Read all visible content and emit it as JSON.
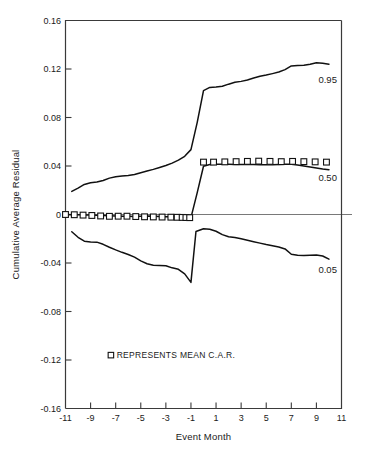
{
  "chart_data": {
    "type": "line",
    "title": "",
    "xlabel": "Event Month",
    "ylabel": "Cumulative Average Residual",
    "xlim": [
      -11,
      11
    ],
    "ylim": [
      -0.16,
      0.16
    ],
    "xticks": [
      -11,
      -9,
      -7,
      -5,
      -3,
      -1,
      1,
      3,
      5,
      7,
      9,
      11
    ],
    "xtick_labels": [
      "-11",
      "-9",
      "-7",
      "-5",
      "-3",
      "-1",
      "1",
      "3",
      "5",
      "7",
      "9",
      "11"
    ],
    "yticks": [
      0.16,
      0.12,
      0.08,
      0.04,
      0,
      -0.04,
      -0.08,
      -0.12,
      -0.16
    ],
    "ytick_labels": [
      "0.16",
      "0.12",
      "0.08",
      "0.04",
      "0",
      "-0.04",
      "-0.08",
      "-0.12",
      "-0.16"
    ],
    "grid": false,
    "zero_line": true,
    "legend": {
      "position": "inside-lower-left",
      "marker": "open-square",
      "text": "REPRESENTS MEAN C.A.R."
    },
    "series": [
      {
        "name": "0.95",
        "label": "0.95",
        "label_x": 9.9,
        "label_y": 0.1115,
        "x": [
          -10.5,
          -10,
          -9.5,
          -9,
          -8.5,
          -8,
          -7.5,
          -7,
          -6.5,
          -6,
          -5.5,
          -5,
          -4.5,
          -4,
          -3.5,
          -3,
          -2.5,
          -2,
          -1.5,
          -1,
          -0.5,
          0,
          0.5,
          1,
          1.5,
          2,
          2.5,
          3,
          3.5,
          4,
          4.5,
          5,
          5.5,
          6,
          6.5,
          7,
          7.5,
          8,
          8.5,
          9,
          9.5,
          10
        ],
        "y": [
          0.019,
          0.0218,
          0.0248,
          0.0262,
          0.0268,
          0.028,
          0.03,
          0.0312,
          0.0318,
          0.0322,
          0.033,
          0.0345,
          0.0358,
          0.0372,
          0.0388,
          0.0404,
          0.0424,
          0.0448,
          0.048,
          0.0535,
          0.076,
          0.1022,
          0.1048,
          0.1052,
          0.1058,
          0.1075,
          0.109,
          0.1098,
          0.111,
          0.1125,
          0.114,
          0.115,
          0.1162,
          0.1175,
          0.1195,
          0.1225,
          0.1228,
          0.123,
          0.124,
          0.1252,
          0.1248,
          0.124
        ]
      },
      {
        "name": "0.50",
        "label": "0.50",
        "label_x": 9.9,
        "label_y": 0.0305,
        "x": [
          -11,
          -10.5,
          -10,
          -9.5,
          -9,
          -8.5,
          -8,
          -7.5,
          -7,
          -6.5,
          -6,
          -5.5,
          -5,
          -4.5,
          -4,
          -3.5,
          -3,
          -2.5,
          -2,
          -1.5,
          -1,
          -0.5,
          0,
          0.5,
          1,
          1.5,
          2,
          2.5,
          3,
          3.5,
          4,
          4.5,
          5,
          5.5,
          6,
          6.5,
          7,
          7.5,
          8,
          8.5,
          9,
          9.5,
          10
        ],
        "y": [
          0.0,
          -0.0002,
          -0.0003,
          -0.0004,
          -0.0005,
          -0.0006,
          -0.0008,
          -0.001,
          -0.0012,
          -0.0014,
          -0.0015,
          -0.0016,
          -0.0014,
          -0.0013,
          -0.0014,
          -0.0016,
          -0.0018,
          -0.0019,
          -0.002,
          -0.0022,
          -0.0026,
          0.018,
          0.0398,
          0.0412,
          0.0414,
          0.0414,
          0.0414,
          0.0413,
          0.0412,
          0.0412,
          0.0412,
          0.0411,
          0.041,
          0.041,
          0.0412,
          0.0414,
          0.0414,
          0.0408,
          0.04,
          0.0392,
          0.0384,
          0.0376,
          0.037
        ]
      },
      {
        "name": "0.05",
        "label": "0.05",
        "label_x": 9.9,
        "label_y": -0.0455,
        "x": [
          -10.5,
          -10,
          -9.5,
          -9,
          -8.5,
          -8,
          -7.5,
          -7,
          -6.5,
          -6,
          -5.5,
          -5,
          -4.5,
          -4,
          -3.5,
          -3,
          -2.5,
          -2,
          -1.5,
          -1,
          -0.6,
          0,
          0.5,
          1,
          1.5,
          2,
          2.5,
          3,
          3.5,
          4,
          4.5,
          5,
          5.5,
          6,
          6.5,
          7,
          7.5,
          8,
          8.5,
          9,
          9.5,
          10
        ],
        "y": [
          -0.0142,
          -0.0188,
          -0.022,
          -0.0226,
          -0.0228,
          -0.0246,
          -0.027,
          -0.0292,
          -0.0312,
          -0.033,
          -0.0352,
          -0.0382,
          -0.0406,
          -0.0418,
          -0.042,
          -0.0422,
          -0.044,
          -0.0452,
          -0.049,
          -0.056,
          -0.014,
          -0.0118,
          -0.0122,
          -0.0138,
          -0.0166,
          -0.0184,
          -0.019,
          -0.02,
          -0.0212,
          -0.0224,
          -0.0236,
          -0.0248,
          -0.0258,
          -0.0268,
          -0.0284,
          -0.0328,
          -0.0336,
          -0.0338,
          -0.0336,
          -0.0334,
          -0.0342,
          -0.0368
        ]
      }
    ],
    "markers": {
      "name": "Mean C.A.R.",
      "shape": "open-square",
      "x": [
        -11,
        -10.3,
        -9.6,
        -8.9,
        -8.2,
        -7.5,
        -6.8,
        -6.1,
        -5.4,
        -4.7,
        -4.0,
        -3.3,
        -2.6,
        -2.1,
        -1.7,
        -1.4,
        -1.1,
        0.0,
        0.8,
        1.7,
        2.6,
        3.5,
        4.4,
        5.3,
        6.2,
        7.1,
        8.0,
        8.9,
        9.8
      ],
      "y": [
        0.0,
        -0.0002,
        -0.0005,
        -0.0008,
        -0.0012,
        -0.0015,
        -0.0014,
        -0.0014,
        -0.0017,
        -0.0019,
        -0.002,
        -0.0021,
        -0.0022,
        -0.0023,
        -0.0024,
        -0.0025,
        -0.0026,
        0.0432,
        0.0432,
        0.0434,
        0.0436,
        0.0438,
        0.044,
        0.0438,
        0.0436,
        0.0438,
        0.0436,
        0.0434,
        0.0432
      ]
    },
    "colors": {
      "curve": "#111111",
      "axis": "#3a3a3a",
      "zero_line": "#6a6a6a",
      "background": "#ffffff",
      "text": "#1a1a1a"
    }
  }
}
